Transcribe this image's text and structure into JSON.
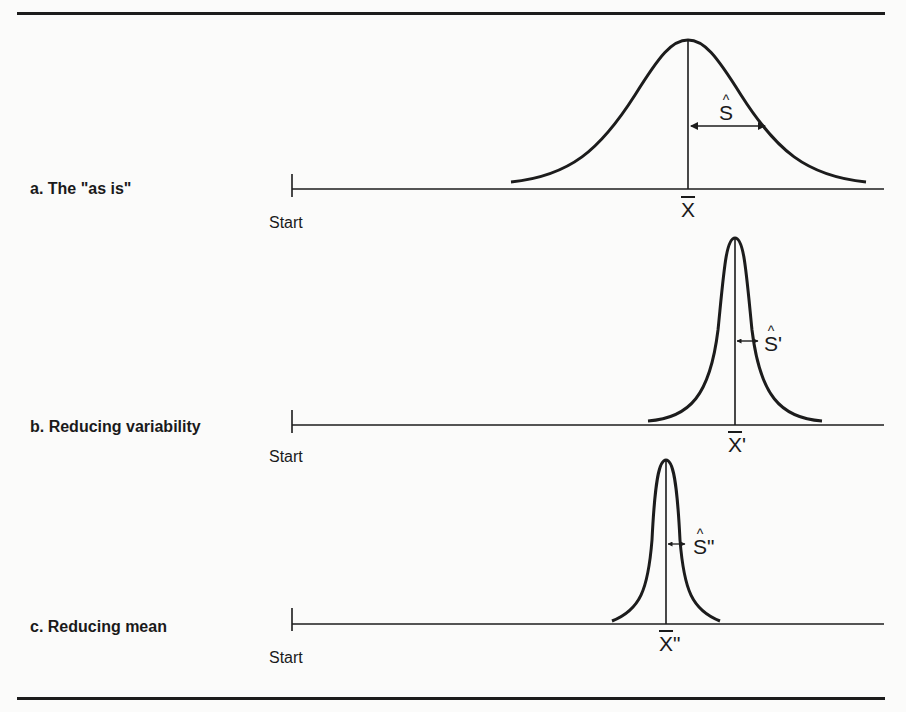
{
  "figure": {
    "panels": [
      {
        "id": "a",
        "label": "a. The \"as is\"",
        "start_label": "Start",
        "mean_symbol": "X",
        "mean_prime": "",
        "sd_symbol": "S",
        "sd_prime": ""
      },
      {
        "id": "b",
        "label": "b. Reducing variability",
        "start_label": "Start",
        "mean_symbol": "X",
        "mean_prime": "'",
        "sd_symbol": "S",
        "sd_prime": "'"
      },
      {
        "id": "c",
        "label": "c. Reducing mean",
        "start_label": "Start",
        "mean_symbol": "X",
        "mean_prime": "\"",
        "sd_symbol": "S",
        "sd_prime": "\""
      }
    ],
    "colors": {
      "ink": "#1c1c1c",
      "background": "#fbfbfa"
    }
  }
}
